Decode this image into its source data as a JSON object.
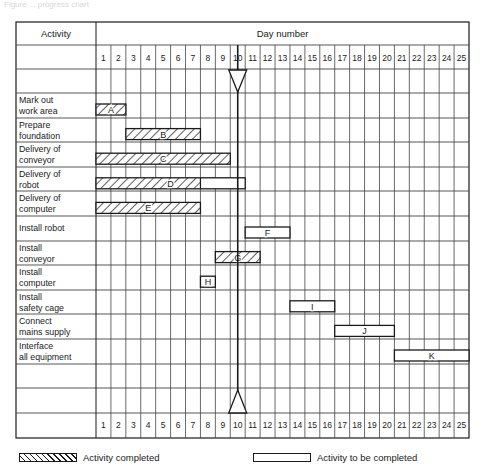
{
  "caption": "Figure ... progress chart",
  "table": {
    "activity_header": "Activity",
    "day_header": "Day number",
    "days": [
      1,
      2,
      3,
      4,
      5,
      6,
      7,
      8,
      9,
      10,
      11,
      12,
      13,
      14,
      15,
      16,
      17,
      18,
      19,
      20,
      21,
      22,
      23,
      24,
      25
    ]
  },
  "legend": {
    "completed_label": "Activity completed",
    "to_be_completed_label": "Activity to be completed"
  },
  "colors": {
    "line": "#1a1a1a",
    "grid": "#444444",
    "background": "#ffffff"
  },
  "chart_data": {
    "type": "gantt",
    "title": "",
    "xlabel": "Day number",
    "ylabel": "Activity",
    "x_range": [
      1,
      25
    ],
    "progress_line_day": 9.5,
    "progress_line_label": "Current date (end of day 9)",
    "activities": [
      {
        "name": "Mark out work area",
        "lines": [
          "Mark out",
          "work area"
        ],
        "code": "A",
        "start": 1,
        "end": 2,
        "completed_to": 2
      },
      {
        "name": "Prepare foundation",
        "lines": [
          "Prepare",
          "foundation"
        ],
        "code": "B",
        "start": 3,
        "end": 7,
        "completed_to": 7
      },
      {
        "name": "Delivery of conveyor",
        "lines": [
          "Delivery of",
          "conveyor"
        ],
        "code": "C",
        "start": 1,
        "end": 9,
        "completed_to": 9
      },
      {
        "name": "Delivery of robot",
        "lines": [
          "Delivery of",
          "robot"
        ],
        "code": "D",
        "start": 1,
        "end": 10,
        "completed_to": 7
      },
      {
        "name": "Delivery of computer",
        "lines": [
          "Delivery of",
          "computer"
        ],
        "code": "E",
        "start": 1,
        "end": 7,
        "completed_to": 7
      },
      {
        "name": "Install robot",
        "lines": [
          "Install robot"
        ],
        "code": "F",
        "start": 11,
        "end": 13,
        "completed_to": 0
      },
      {
        "name": "Install conveyor",
        "lines": [
          "Install",
          "conveyor"
        ],
        "code": "G",
        "start": 9,
        "end": 11,
        "completed_to": 11
      },
      {
        "name": "Install computer",
        "lines": [
          "Install",
          "computer"
        ],
        "code": "H",
        "start": 8,
        "end": 8,
        "completed_to": 0
      },
      {
        "name": "Install safety cage",
        "lines": [
          "Install",
          "safety cage"
        ],
        "code": "I",
        "start": 14,
        "end": 16,
        "completed_to": 0
      },
      {
        "name": "Connect mains supply",
        "lines": [
          "Connect",
          "mains supply"
        ],
        "code": "J",
        "start": 17,
        "end": 20,
        "completed_to": 0
      },
      {
        "name": "Interface all equipment",
        "lines": [
          "Interface",
          "all equipment"
        ],
        "code": "K",
        "start": 21,
        "end": 25,
        "completed_to": 0
      }
    ],
    "legend": [
      {
        "style": "hatched",
        "label": "Activity completed"
      },
      {
        "style": "open",
        "label": "Activity to be completed"
      }
    ]
  }
}
